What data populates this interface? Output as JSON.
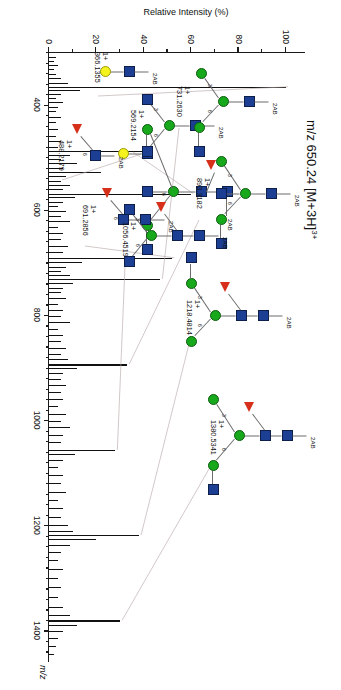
{
  "title": "m/z 650.24 [M+3H]3+",
  "title_parts": {
    "prefix": "m/z 650.24 [M+3H]",
    "superscript": "3+"
  },
  "axes": {
    "x_title": "m/z",
    "y_title": "Relative Intensity (%)",
    "x_ticks": [
      400,
      600,
      800,
      1000,
      1200,
      1400
    ],
    "x_min": 300,
    "x_max": 1460,
    "y_ticks": [
      0,
      20,
      40,
      60,
      80,
      100
    ],
    "y_min": 0,
    "y_max": 108
  },
  "labels": {
    "charge": "1+",
    "tag": "2AB",
    "linkage_6": "6",
    "linkage_3": "3",
    "linkage_4": "4",
    "linkage_2": "2"
  },
  "annotations": [
    {
      "name": "fragment-366",
      "mz": "366.1355",
      "charge": "1+",
      "has_2ab": true
    },
    {
      "name": "fragment-488",
      "mz": "488.2179",
      "charge": "1+",
      "has_2ab": true
    },
    {
      "name": "fragment-569",
      "mz": "569.2154",
      "charge": "1+",
      "has_2ab": true
    },
    {
      "name": "fragment-691",
      "mz": "691.2856",
      "charge": "1+",
      "has_2ab": true
    },
    {
      "name": "fragment-731",
      "mz": "731.2630",
      "charge": "1+",
      "has_2ab": true
    },
    {
      "name": "fragment-893",
      "mz": "893.3182",
      "charge": "1+",
      "has_2ab": true
    },
    {
      "name": "fragment-1056",
      "mz": "1056.4519",
      "charge": "1+",
      "has_2ab": true
    },
    {
      "name": "fragment-1218",
      "mz": "1218.4814",
      "charge": "1+",
      "has_2ab": true
    },
    {
      "name": "fragment-1380",
      "mz": "1380.5341",
      "charge": "1+",
      "has_2ab": true
    }
  ],
  "colors": {
    "glcnac_blue": "#1c3f94",
    "mannose_green": "#18a81c",
    "galactose_yellow": "#f5f31e",
    "fucose_red": "#d6301b",
    "bond_gray": "#6d6d6d",
    "axis_black": "#1a1a1a"
  },
  "chart_data": {
    "type": "line",
    "title": "m/z 650.24 [M+3H]3+",
    "xlabel": "m/z",
    "ylabel": "Relative Intensity (%)",
    "xlim": [
      300,
      1460
    ],
    "ylim": [
      0,
      108
    ],
    "grid": false,
    "legend": "none",
    "x_tick_labels": [
      "400",
      "600",
      "800",
      "1000",
      "1200",
      "1400"
    ],
    "y_tick_labels": [
      "0",
      "20",
      "40",
      "60",
      "80",
      "100"
    ],
    "peaks": [
      {
        "mz": 310.0,
        "intensity": 3
      },
      {
        "mz": 317.0,
        "intensity": 2
      },
      {
        "mz": 325.0,
        "intensity": 4
      },
      {
        "mz": 333.0,
        "intensity": 2
      },
      {
        "mz": 342.0,
        "intensity": 3
      },
      {
        "mz": 350.0,
        "intensity": 5
      },
      {
        "mz": 358.0,
        "intensity": 8
      },
      {
        "mz": 366.1355,
        "intensity": 100,
        "label": "366.1355",
        "charge": "1+"
      },
      {
        "mz": 372.0,
        "intensity": 13
      },
      {
        "mz": 380.0,
        "intensity": 5
      },
      {
        "mz": 388.0,
        "intensity": 3
      },
      {
        "mz": 396.0,
        "intensity": 6
      },
      {
        "mz": 405.0,
        "intensity": 4
      },
      {
        "mz": 413.0,
        "intensity": 3
      },
      {
        "mz": 424.0,
        "intensity": 5
      },
      {
        "mz": 433.0,
        "intensity": 3
      },
      {
        "mz": 447.0,
        "intensity": 4
      },
      {
        "mz": 459.0,
        "intensity": 3
      },
      {
        "mz": 470.0,
        "intensity": 5
      },
      {
        "mz": 480.0,
        "intensity": 4
      },
      {
        "mz": 488.2179,
        "intensity": 42,
        "label": "488.2179",
        "charge": "1+"
      },
      {
        "mz": 495.0,
        "intensity": 9
      },
      {
        "mz": 504.0,
        "intensity": 5
      },
      {
        "mz": 512.0,
        "intensity": 12
      },
      {
        "mz": 521.0,
        "intensity": 6
      },
      {
        "mz": 528.0,
        "intensity": 22
      },
      {
        "mz": 536.0,
        "intensity": 7
      },
      {
        "mz": 545.0,
        "intensity": 5
      },
      {
        "mz": 553.0,
        "intensity": 9
      },
      {
        "mz": 561.0,
        "intensity": 6
      },
      {
        "mz": 569.2154,
        "intensity": 60,
        "label": "569.2154",
        "charge": "1+"
      },
      {
        "mz": 576.0,
        "intensity": 11
      },
      {
        "mz": 585.0,
        "intensity": 6
      },
      {
        "mz": 593.0,
        "intensity": 4
      },
      {
        "mz": 602.0,
        "intensity": 7
      },
      {
        "mz": 612.0,
        "intensity": 5
      },
      {
        "mz": 622.0,
        "intensity": 9
      },
      {
        "mz": 633.0,
        "intensity": 4
      },
      {
        "mz": 645.0,
        "intensity": 6
      },
      {
        "mz": 656.0,
        "intensity": 5
      },
      {
        "mz": 668.0,
        "intensity": 8
      },
      {
        "mz": 680.0,
        "intensity": 6
      },
      {
        "mz": 691.2856,
        "intensity": 52,
        "label": "691.2856",
        "charge": "1+"
      },
      {
        "mz": 699.0,
        "intensity": 14
      },
      {
        "mz": 708.0,
        "intensity": 7
      },
      {
        "mz": 717.0,
        "intensity": 5
      },
      {
        "mz": 724.0,
        "intensity": 9
      },
      {
        "mz": 731.263,
        "intensity": 47,
        "label": "731.2630",
        "charge": "1+"
      },
      {
        "mz": 739.0,
        "intensity": 10
      },
      {
        "mz": 748.0,
        "intensity": 6
      },
      {
        "mz": 757.0,
        "intensity": 5
      },
      {
        "mz": 768.0,
        "intensity": 7
      },
      {
        "mz": 779.0,
        "intensity": 4
      },
      {
        "mz": 790.0,
        "intensity": 6
      },
      {
        "mz": 802.0,
        "intensity": 5
      },
      {
        "mz": 814.0,
        "intensity": 9
      },
      {
        "mz": 826.0,
        "intensity": 4
      },
      {
        "mz": 838.0,
        "intensity": 6
      },
      {
        "mz": 850.0,
        "intensity": 5
      },
      {
        "mz": 862.0,
        "intensity": 7
      },
      {
        "mz": 874.0,
        "intensity": 5
      },
      {
        "mz": 884.0,
        "intensity": 8
      },
      {
        "mz": 893.3182,
        "intensity": 33,
        "label": "893.3182",
        "charge": "1+"
      },
      {
        "mz": 901.0,
        "intensity": 12
      },
      {
        "mz": 911.0,
        "intensity": 6
      },
      {
        "mz": 922.0,
        "intensity": 5
      },
      {
        "mz": 934.0,
        "intensity": 7
      },
      {
        "mz": 947.0,
        "intensity": 5
      },
      {
        "mz": 960.0,
        "intensity": 6
      },
      {
        "mz": 974.0,
        "intensity": 4
      },
      {
        "mz": 988.0,
        "intensity": 7
      },
      {
        "mz": 1001.0,
        "intensity": 5
      },
      {
        "mz": 1014.0,
        "intensity": 9
      },
      {
        "mz": 1028.0,
        "intensity": 6
      },
      {
        "mz": 1042.0,
        "intensity": 5
      },
      {
        "mz": 1056.4519,
        "intensity": 28,
        "label": "1056.4519",
        "charge": "1+"
      },
      {
        "mz": 1065.0,
        "intensity": 11
      },
      {
        "mz": 1076.0,
        "intensity": 6
      },
      {
        "mz": 1090.0,
        "intensity": 4
      },
      {
        "mz": 1105.0,
        "intensity": 6
      },
      {
        "mz": 1120.0,
        "intensity": 5
      },
      {
        "mz": 1136.0,
        "intensity": 7
      },
      {
        "mz": 1152.0,
        "intensity": 4
      },
      {
        "mz": 1168.0,
        "intensity": 6
      },
      {
        "mz": 1184.0,
        "intensity": 5
      },
      {
        "mz": 1200.0,
        "intensity": 8
      },
      {
        "mz": 1210.0,
        "intensity": 10
      },
      {
        "mz": 1218.4814,
        "intensity": 38,
        "label": "1218.4814",
        "charge": "1+"
      },
      {
        "mz": 1227.0,
        "intensity": 20
      },
      {
        "mz": 1237.0,
        "intensity": 9
      },
      {
        "mz": 1250.0,
        "intensity": 5
      },
      {
        "mz": 1266.0,
        "intensity": 4
      },
      {
        "mz": 1283.0,
        "intensity": 6
      },
      {
        "mz": 1300.0,
        "intensity": 4
      },
      {
        "mz": 1318.0,
        "intensity": 5
      },
      {
        "mz": 1336.0,
        "intensity": 4
      },
      {
        "mz": 1355.0,
        "intensity": 6
      },
      {
        "mz": 1370.0,
        "intensity": 9
      },
      {
        "mz": 1380.5341,
        "intensity": 30,
        "label": "1380.5341",
        "charge": "1+"
      },
      {
        "mz": 1390.0,
        "intensity": 12
      },
      {
        "mz": 1401.0,
        "intensity": 6
      },
      {
        "mz": 1415.0,
        "intensity": 4
      },
      {
        "mz": 1430.0,
        "intensity": 3
      },
      {
        "mz": 1445.0,
        "intensity": 2
      }
    ]
  }
}
